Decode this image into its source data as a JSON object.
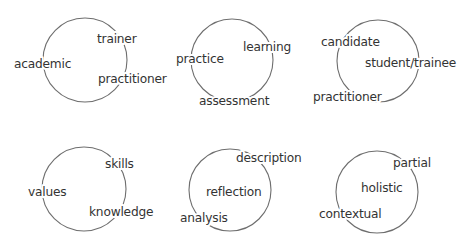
{
  "diagram": {
    "colors": {
      "background": "#ffffff",
      "circle_stroke": "#6e6e6e",
      "text": "#333333"
    },
    "circles": [
      {
        "id": "circle-1",
        "cx": 85,
        "cy": 60,
        "r": 42,
        "labels": [
          {
            "text": "academic",
            "x": 14,
            "y": 68
          },
          {
            "text": "trainer",
            "x": 97,
            "y": 43
          },
          {
            "text": "practitioner",
            "x": 98,
            "y": 83
          }
        ]
      },
      {
        "id": "circle-2",
        "cx": 232,
        "cy": 60,
        "r": 41,
        "labels": [
          {
            "text": "practice",
            "x": 176,
            "y": 63
          },
          {
            "text": "learning",
            "x": 243,
            "y": 51
          },
          {
            "text": "assessment",
            "x": 199,
            "y": 105
          }
        ]
      },
      {
        "id": "circle-3",
        "cx": 378,
        "cy": 61,
        "r": 41,
        "labels": [
          {
            "text": "candidate",
            "x": 321,
            "y": 46
          },
          {
            "text": "student/trainee",
            "x": 365,
            "y": 67
          },
          {
            "text": "practitioner",
            "x": 313,
            "y": 101
          }
        ]
      },
      {
        "id": "circle-4",
        "cx": 84,
        "cy": 189,
        "r": 42,
        "labels": [
          {
            "text": "values",
            "x": 28,
            "y": 196
          },
          {
            "text": "skills",
            "x": 105,
            "y": 168
          },
          {
            "text": "knowledge",
            "x": 89,
            "y": 216
          }
        ]
      },
      {
        "id": "circle-5",
        "cx": 230,
        "cy": 190,
        "r": 41,
        "labels": [
          {
            "text": "description",
            "x": 236,
            "y": 162
          },
          {
            "text": "reflection",
            "x": 206,
            "y": 196
          },
          {
            "text": "analysis",
            "x": 180,
            "y": 222
          }
        ]
      },
      {
        "id": "circle-6",
        "cx": 377,
        "cy": 192,
        "r": 41,
        "labels": [
          {
            "text": "partial",
            "x": 393,
            "y": 167
          },
          {
            "text": "holistic",
            "x": 361,
            "y": 192
          },
          {
            "text": "contextual",
            "x": 319,
            "y": 218
          }
        ]
      }
    ]
  }
}
